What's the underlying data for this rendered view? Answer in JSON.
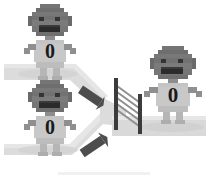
{
  "scene": {
    "title": "Three robots on merging roads with a gate",
    "width": 216,
    "height": 181,
    "background": "#ffffff"
  },
  "palette": {
    "background": "#ffffff",
    "road_fill": "#d7d7d7",
    "road_fill_light": "#e2e2e2",
    "road_shadow": "#cfcfcf",
    "robot_body": "#b4b4b4",
    "robot_body_light": "#c8c8c8",
    "robot_head": "#7d7d7d",
    "robot_head_dark": "#6e6e6e",
    "robot_limb": "#8c8c8c",
    "robot_eye": "#3a3a3a",
    "robot_mouth": "#2e2e2e",
    "chest_digit": "#1a1a1a",
    "arrow_dark": "#4a4a4a",
    "gate_post": "#3d3d3d",
    "gate_slat": "#8a8a8a"
  },
  "robots": [
    {
      "id": "robot-top-left",
      "label": "0",
      "position": {
        "x": 22,
        "y": 6
      },
      "scale": 1.0,
      "road": "upper-left-lane"
    },
    {
      "id": "robot-bottom-left",
      "label": "0",
      "position": {
        "x": 22,
        "y": 92
      },
      "scale": 1.0,
      "road": "lower-left-lane"
    },
    {
      "id": "robot-right",
      "label": "0",
      "position": {
        "x": 143,
        "y": 48
      },
      "scale": 1.0,
      "road": "right-lane"
    }
  ],
  "roads": {
    "upper_lane_label": "upper-left-lane",
    "lower_lane_label": "lower-left-lane",
    "merge_label": "merge-junction",
    "right_lane_label": "right-lane"
  },
  "gate": {
    "id": "merge-gate",
    "position": {
      "x": 112,
      "y": 79
    },
    "post_count": 2,
    "slat_count": 5
  },
  "arrows": [
    {
      "id": "arrow-upper",
      "position": {
        "x": 84,
        "y": 90
      },
      "angle": 35,
      "direction": "down-right"
    },
    {
      "id": "arrow-lower",
      "position": {
        "x": 86,
        "y": 138
      },
      "angle": -35,
      "direction": "up-right"
    }
  ],
  "chest_digits": {
    "top_left": "0",
    "bottom_left": "0",
    "right": "0"
  }
}
